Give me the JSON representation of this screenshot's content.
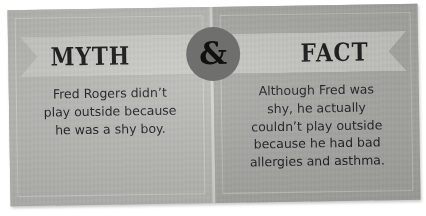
{
  "card": {
    "divider_label": "&",
    "panels": [
      {
        "id": "myth",
        "banner_label": "MYTH",
        "body": "Fred Rogers didn’t\nplay outside because\nhe was a shy boy."
      },
      {
        "id": "fact",
        "banner_label": "FACT",
        "body": "Although Fred was\nshy, he actually\ncouldn’t play outside\nbecause he had bad\nallergies and asthma."
      }
    ]
  },
  "colors": {
    "myth_panel": "#b9b9b5",
    "fact_panel": "#a8a8a4",
    "banner": "#cacac5",
    "badge": "#6f6f6d",
    "text": "#191919",
    "frame": "#cfcfca"
  }
}
